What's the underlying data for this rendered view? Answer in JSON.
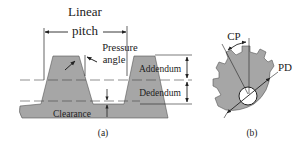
{
  "figure": {
    "panel_a": {
      "caption": "(a)",
      "labels": {
        "linear": "Linear",
        "pitch": "pitch",
        "pressure": "Pressure",
        "angle": "angle",
        "addendum": "Addendum",
        "dedendum": "Dedendum",
        "clearance": "Clearance"
      }
    },
    "panel_b": {
      "caption": "(b)",
      "labels": {
        "cp": "CP",
        "pd": "PD"
      }
    },
    "colors": {
      "tooth_fill": "#a6a6a6",
      "line": "#222222",
      "background": "#ffffff"
    }
  }
}
